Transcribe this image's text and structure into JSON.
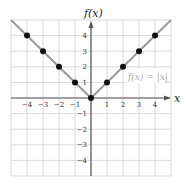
{
  "chart_data": {
    "type": "line",
    "title": "",
    "xlabel": "x",
    "ylabel": "f(x)",
    "xlim": [
      -5,
      5
    ],
    "ylim": [
      -5,
      5
    ],
    "grid": true,
    "x_ticks": [
      -4,
      -3,
      -2,
      -1,
      1,
      2,
      3,
      4
    ],
    "y_ticks": [
      4,
      3,
      2,
      1,
      -1,
      -2,
      -3,
      -4
    ],
    "annotation": "f(x) = |x|",
    "series": [
      {
        "name": "f(x) = |x|",
        "kind": "line",
        "x": [
          -5,
          0,
          5
        ],
        "y": [
          5,
          0,
          5
        ]
      },
      {
        "name": "plotted points",
        "kind": "scatter",
        "x": [
          -4,
          -3,
          -2,
          -1,
          0,
          1,
          2,
          3,
          4
        ],
        "y": [
          4,
          3,
          2,
          1,
          0,
          1,
          2,
          3,
          4
        ]
      }
    ],
    "colors": {
      "grid": "#cfcfcf",
      "axes": "#555555",
      "line": "#9a9a9a",
      "points": "#111111",
      "annotation": "#a8a8a8"
    }
  }
}
